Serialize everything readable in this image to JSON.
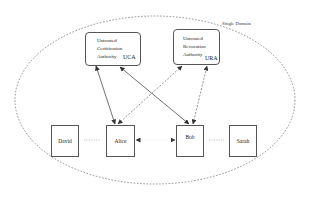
{
  "domain": {
    "label": "Single Domain",
    "style": "dashed-ellipse",
    "color": "#777777"
  },
  "authorities": [
    {
      "id": "uca",
      "lines": [
        "Untrusted",
        "Certification",
        "Authority"
      ],
      "abbr": "UCA"
    },
    {
      "id": "ura",
      "lines": [
        "Untrusted",
        "Revocation",
        "Authority"
      ],
      "abbr": "URA"
    }
  ],
  "users": [
    {
      "id": "david",
      "label": "David"
    },
    {
      "id": "alice",
      "label": "Alice"
    },
    {
      "id": "bob",
      "label": "Bob"
    },
    {
      "id": "sarah",
      "label": "Sarah"
    }
  ],
  "edges": [
    {
      "from": "alice",
      "to": "uca",
      "style": "solid",
      "arrows": "both"
    },
    {
      "from": "bob",
      "to": "uca",
      "style": "solid",
      "arrows": "both"
    },
    {
      "from": "alice",
      "to": "ura",
      "style": "dashed",
      "arrows": "both"
    },
    {
      "from": "bob",
      "to": "ura",
      "style": "dashed",
      "arrows": "both"
    },
    {
      "from": "david",
      "to": "alice",
      "style": "dotted",
      "arrows": "none"
    },
    {
      "from": "alice",
      "to": "bob",
      "style": "dotted",
      "arrows": "both"
    },
    {
      "from": "bob",
      "to": "sarah",
      "style": "dotted",
      "arrows": "none"
    }
  ],
  "colors": {
    "stroke": "#333333",
    "dashed": "#777777",
    "background": "#ffffff"
  }
}
